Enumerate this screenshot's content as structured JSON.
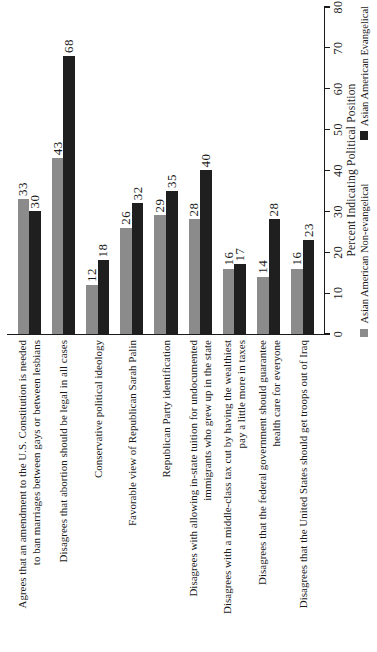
{
  "page": {
    "background": "#ffffff"
  },
  "chart_data": {
    "type": "bar",
    "orientation": "horizontal",
    "page_rotation_deg": -90,
    "title": "",
    "value_axis": {
      "label": "Percent Indicating Political Position",
      "min": 0,
      "max": 80,
      "tick_step": 10,
      "ticks": [
        0,
        10,
        20,
        30,
        40,
        50,
        60,
        70,
        80
      ]
    },
    "grid": false,
    "value_labels_shown": true,
    "legend_position": "bottom-right",
    "axis_color": "#1a1a1a",
    "text_color": "#1a1a1a",
    "categories": [
      {
        "lines": [
          "Agrees that an amendment to the U.S. Constitution is needed",
          "to ban marriages between gays or between lesbians"
        ]
      },
      {
        "lines": [
          "Disagrees that abortion should be legal in all cases"
        ]
      },
      {
        "lines": [
          "Conservative political ideology"
        ]
      },
      {
        "lines": [
          "Favorable view of Republican Sarah Palin"
        ]
      },
      {
        "lines": [
          "Republican Party identification"
        ]
      },
      {
        "lines": [
          "Disagrees with allowing in-state tuition for undocumented",
          "immigrants who grew up in the state"
        ]
      },
      {
        "lines": [
          "Disagrees with a middle-class tax cut by having the wealthiest",
          "pay a little more in taxes"
        ]
      },
      {
        "lines": [
          "Disagrees that the federal government should guarantee",
          "health care for everyone"
        ]
      },
      {
        "lines": [
          "Disagrees that the United States should get troops out of Iraq"
        ]
      }
    ],
    "series": [
      {
        "name": "Asian American Non-evangelical",
        "color": "#8b8b8b",
        "values": [
          33,
          43,
          12,
          26,
          29,
          28,
          16,
          14,
          16
        ]
      },
      {
        "name": "Asian American Evangelical",
        "color": "#1f1f1f",
        "values": [
          30,
          68,
          18,
          32,
          35,
          40,
          17,
          28,
          23
        ]
      }
    ]
  }
}
